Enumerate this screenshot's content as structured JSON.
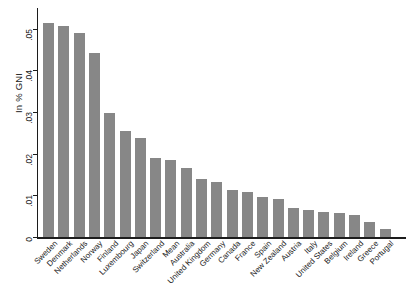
{
  "chart_data": {
    "type": "bar",
    "title": "",
    "xlabel": "",
    "ylabel": "In % GNI",
    "ylim": [
      0,
      0.055
    ],
    "yticks": [
      0,
      0.01,
      0.02,
      0.03,
      0.04,
      0.05
    ],
    "ytick_labels": [
      "0",
      ".01",
      ".02",
      ".03",
      ".04",
      ".05"
    ],
    "grid": false,
    "legend": null,
    "bar_color": "#878787",
    "axis_color": "#1c1c1c",
    "categories": [
      "Sweden",
      "Denmark",
      "Netherlands",
      "Norway",
      "Finland",
      "Luxembourg",
      "Japan",
      "Switzerland",
      "Mean",
      "Australia",
      "United Kingdom",
      "Germany",
      "Canada",
      "France",
      "Spain",
      "New Zealand",
      "Austria",
      "Italy",
      "United States",
      "Belgium",
      "Ireland",
      "Greece",
      "Portugal"
    ],
    "values": [
      0.0513,
      0.0506,
      0.0489,
      0.0441,
      0.0299,
      0.0254,
      0.0239,
      0.019,
      0.0185,
      0.0166,
      0.014,
      0.0132,
      0.0112,
      0.0109,
      0.0096,
      0.0092,
      0.0069,
      0.0064,
      0.0061,
      0.0057,
      0.0052,
      0.0035,
      0.0019
    ]
  }
}
